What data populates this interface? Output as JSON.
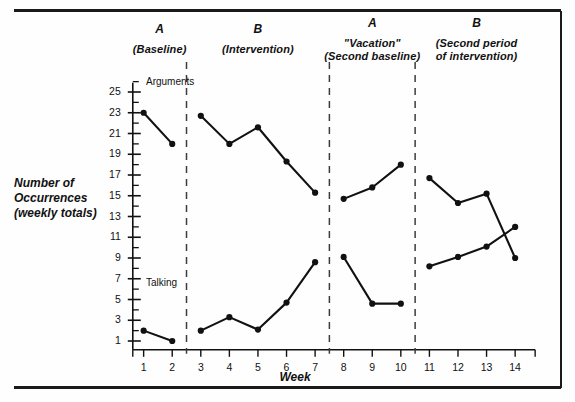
{
  "figure": {
    "y_axis_title": "Number of\nOccurrences\n(weekly totals)",
    "y_axis_title_lines": [
      "Number of",
      "Occurrences",
      "(weekly totals)"
    ],
    "x_axis_title": "Week",
    "series_labels": {
      "arguments": "Arguments",
      "talking": "Talking"
    }
  },
  "phases": [
    {
      "letter": "A",
      "sub_lines": [
        "(Baseline)"
      ],
      "weeks": [
        1,
        2
      ]
    },
    {
      "letter": "B",
      "sub_lines": [
        "(Intervention)"
      ],
      "weeks": [
        3,
        4,
        5,
        6,
        7
      ]
    },
    {
      "letter": "A",
      "sub_lines": [
        "\"Vacation\"",
        "(Second baseline)"
      ],
      "weeks": [
        8,
        9,
        10
      ]
    },
    {
      "letter": "B",
      "sub_lines": [
        "(Second period",
        "of intervention)"
      ],
      "weeks": [
        11,
        12,
        13,
        14
      ]
    }
  ],
  "chart_data": {
    "type": "line",
    "title": "",
    "xlabel": "Week",
    "ylabel": "Number of Occurrences (weekly totals)",
    "x": [
      1,
      2,
      3,
      4,
      5,
      6,
      7,
      8,
      9,
      10,
      11,
      12,
      13,
      14
    ],
    "xticklabels": [
      "1",
      "2",
      "3",
      "4",
      "5",
      "6",
      "7",
      "8",
      "9",
      "10",
      "11",
      "12",
      "13",
      "14"
    ],
    "xlim": [
      0.4,
      14.8
    ],
    "ylim": [
      0,
      26
    ],
    "yticks": [
      1,
      3,
      5,
      7,
      9,
      11,
      13,
      15,
      17,
      19,
      21,
      23,
      25
    ],
    "yticklabels": [
      "1",
      "3",
      "5",
      "7",
      "9",
      "11",
      "13",
      "15",
      "17",
      "19",
      "21",
      "23",
      "25"
    ],
    "yminorticks": [
      2,
      4,
      6,
      8,
      10,
      12,
      14,
      16,
      18,
      20,
      22,
      24,
      26
    ],
    "grid": false,
    "legend": "inline-labels",
    "phase_dividers": [
      2.5,
      7.5,
      10.5
    ],
    "series": [
      {
        "name": "Arguments",
        "marker": "filled-circle",
        "color": "#111111",
        "segments": [
          {
            "phase": "A",
            "x": [
              1,
              2
            ],
            "values": [
              23,
              20
            ]
          },
          {
            "phase": "B",
            "x": [
              3,
              4,
              5,
              6,
              7
            ],
            "values": [
              22.7,
              20,
              21.6,
              18.3,
              15.3
            ]
          },
          {
            "phase": "A",
            "x": [
              8,
              9,
              10
            ],
            "values": [
              14.7,
              15.8,
              18
            ]
          },
          {
            "phase": "B",
            "x": [
              11,
              12,
              13,
              14
            ],
            "values": [
              16.7,
              14.3,
              15.2,
              9
            ]
          }
        ]
      },
      {
        "name": "Talking",
        "marker": "filled-circle",
        "color": "#111111",
        "segments": [
          {
            "phase": "A",
            "x": [
              1,
              2
            ],
            "values": [
              2,
              1
            ]
          },
          {
            "phase": "B",
            "x": [
              3,
              4,
              5,
              6,
              7
            ],
            "values": [
              2,
              3.3,
              2.1,
              4.7,
              8.6
            ]
          },
          {
            "phase": "A",
            "x": [
              8,
              9,
              10
            ],
            "values": [
              9.1,
              4.6,
              4.6
            ]
          },
          {
            "phase": "B",
            "x": [
              11,
              12,
              13,
              14
            ],
            "values": [
              8.2,
              9.1,
              10.1,
              12
            ]
          }
        ]
      }
    ]
  }
}
